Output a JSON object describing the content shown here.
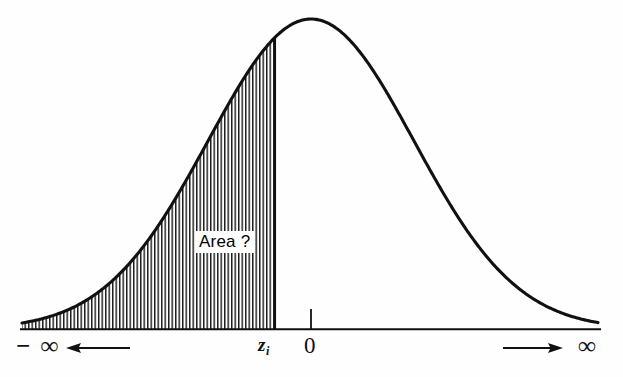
{
  "figure": {
    "type": "normal-distribution-diagram",
    "title": "",
    "background_color": "#fefefe",
    "ink_color": "#111111"
  },
  "labels": {
    "negative_infinity": "− ∞",
    "positive_infinity": "∞",
    "z_value": "z",
    "z_subscript": "i",
    "origin": "0",
    "area_question": "Area ?"
  },
  "icons": {
    "left_arrow": "left-arrow-icon",
    "right_arrow": "right-arrow-icon",
    "origin_tick": "origin-tick-icon"
  },
  "chart_data": {
    "type": "area",
    "title": "",
    "xlabel": "",
    "ylabel": "",
    "curve": {
      "name": "normal density",
      "mean_label": "0",
      "mean_px": 311,
      "peak_px_y": 19,
      "baseline_px_y": 329,
      "left_end_px_x": 22,
      "right_end_px_x": 598,
      "sigma_px": 103
    },
    "shaded_region": {
      "label": "Area ?",
      "from": "− ∞",
      "to": "z",
      "to_subscript": "i",
      "boundary_px_x": 275,
      "fill": "vertical-hatch",
      "hatch_spacing_px": 3.5,
      "hatch_line_width_px": 1.4
    },
    "axis": {
      "baseline_px_y": 329,
      "left_px_x": 20,
      "right_px_x": 601,
      "ticks": [
        {
          "label": "z",
          "subscript": "i",
          "px_x": 275
        },
        {
          "label": "0",
          "px_x": 311
        }
      ],
      "endpoints": [
        {
          "label": "− ∞",
          "px_x": 36
        },
        {
          "label": "∞",
          "px_x": 590
        }
      ],
      "arrows": [
        {
          "name": "left-arrow-icon",
          "direction": "left",
          "from_px_x": 128,
          "to_px_x": 68,
          "px_y": 348
        },
        {
          "name": "right-arrow-icon",
          "direction": "right",
          "from_px_x": 505,
          "to_px_x": 562,
          "px_y": 348
        }
      ],
      "grid": false,
      "legend": "none"
    }
  }
}
